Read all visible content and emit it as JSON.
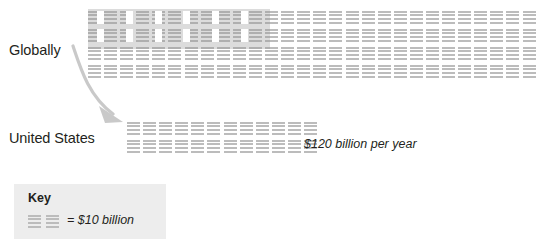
{
  "chart_data": {
    "type": "pictogram",
    "title": "",
    "unit_label": "= $10 billion",
    "unit_value": 10,
    "unit_currency": "$",
    "unit_scale": "billion",
    "icon_name": "building-icon",
    "rows": [
      {
        "label": "Globally",
        "icon_rows": 4,
        "icons_per_row": 28,
        "total_icons": 112,
        "value_note": "",
        "highlight": {
          "present": true,
          "icon_rows": 2,
          "icons_per_row": 6,
          "total_icons": 12,
          "represents": "United States share"
        }
      },
      {
        "label": "United States",
        "icon_rows": 2,
        "icons_per_row": 12,
        "total_icons": 24,
        "value_note": "$120 billion per year",
        "highlight": {
          "present": false
        }
      }
    ],
    "annotations": [
      {
        "name": "callout-arrow",
        "from": "Globally",
        "to": "United States"
      }
    ],
    "legend": {
      "position": "bottom-left",
      "title": "Key",
      "entries": [
        {
          "swatch_count": 2,
          "label": "= $10 billion"
        }
      ]
    }
  },
  "labels": {
    "globally": "Globally",
    "united_states": "United States",
    "us_value": "$120 billion per year"
  },
  "key": {
    "title": "Key",
    "text": "= $10 billion"
  },
  "colors": {
    "icon": "#bcbcbc",
    "highlight": "#969696",
    "text": "#231f20",
    "key_background": "#ededed",
    "arrow": "#c8c8c8",
    "page_background": "#ffffff"
  }
}
